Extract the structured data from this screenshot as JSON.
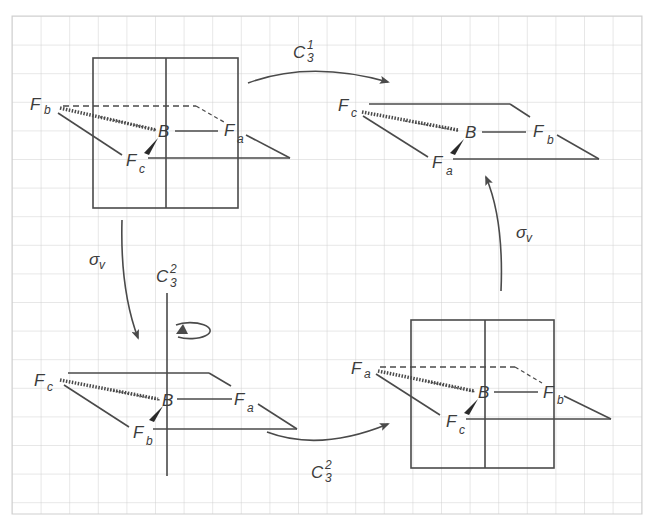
{
  "diagram": {
    "type": "symmetry-operations-cycle",
    "colors": {
      "grid": "#cfcfcf",
      "ink": "#4a4a4a",
      "background": "#ffffff"
    },
    "molecules": [
      {
        "id": "top-left",
        "central": "B",
        "ligands": {
          "left": "F",
          "left_sub": "b",
          "right": "F",
          "right_sub": "a",
          "front": "F",
          "front_sub": "c"
        },
        "mirror_plane": true
      },
      {
        "id": "top-right",
        "central": "B",
        "ligands": {
          "left": "F",
          "left_sub": "c",
          "right": "F",
          "right_sub": "b",
          "front": "F",
          "front_sub": "a"
        },
        "mirror_plane": false
      },
      {
        "id": "bottom-left",
        "central": "B",
        "ligands": {
          "left": "F",
          "left_sub": "c",
          "right": "F",
          "right_sub": "a",
          "front": "F",
          "front_sub": "b"
        },
        "rotation_axis": true
      },
      {
        "id": "bottom-right",
        "central": "B",
        "ligands": {
          "left": "F",
          "left_sub": "a",
          "right": "F",
          "right_sub": "b",
          "front": "F",
          "front_sub": "c"
        },
        "mirror_plane": true
      }
    ],
    "arrows": [
      {
        "id": "top",
        "from": "top-left",
        "to": "top-right",
        "label": "C",
        "sub": "3",
        "sup": "1"
      },
      {
        "id": "left",
        "from": "top-left",
        "to": "bottom-left",
        "label": "σ",
        "sub": "v"
      },
      {
        "id": "axis",
        "label": "C",
        "sub": "3",
        "sup": "2"
      },
      {
        "id": "bottom",
        "from": "bottom-left",
        "to": "bottom-right",
        "label": "C",
        "sub": "3",
        "sup": "2"
      },
      {
        "id": "right",
        "from": "bottom-right",
        "to": "top-right",
        "label": "σ",
        "sub": "v"
      }
    ]
  }
}
